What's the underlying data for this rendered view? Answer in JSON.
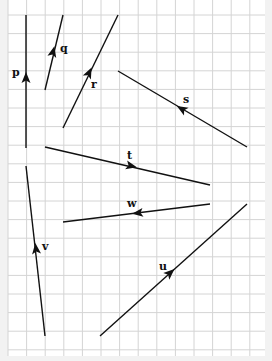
{
  "diagram": {
    "type": "vector-grid",
    "grid": {
      "x0": 8,
      "y0": -4,
      "x1": 265,
      "y1": 356,
      "cell": 18.6,
      "line_color": "#d4d4d4",
      "background": "#ffffff"
    },
    "line_color": "#111111",
    "vectors": [
      {
        "name": "p",
        "label": "p",
        "from": [
          26,
          148
        ],
        "to": [
          26,
          15
        ],
        "arrow": [
          26,
          78
        ],
        "label_pos": [
          12,
          76
        ]
      },
      {
        "name": "q",
        "label": "q",
        "from": [
          45,
          90
        ],
        "to": [
          63,
          15
        ],
        "arrow": [
          53,
          52
        ],
        "label_pos": [
          60,
          52
        ]
      },
      {
        "name": "r",
        "label": "r",
        "from": [
          63,
          128
        ],
        "to": [
          118,
          15
        ],
        "arrow": [
          89,
          73
        ],
        "label_pos": [
          91,
          88
        ]
      },
      {
        "name": "s",
        "label": "s",
        "from": [
          247,
          147
        ],
        "to": [
          118,
          71
        ],
        "arrow": [
          182,
          109
        ],
        "label_pos": [
          183,
          103
        ]
      },
      {
        "name": "t",
        "label": "t",
        "from": [
          45,
          147
        ],
        "to": [
          210,
          185
        ],
        "arrow": [
          131,
          166
        ],
        "label_pos": [
          127,
          159
        ]
      },
      {
        "name": "w",
        "label": "w",
        "from": [
          210,
          204
        ],
        "to": [
          63,
          222
        ],
        "arrow": [
          138,
          213
        ],
        "label_pos": [
          127,
          207
        ]
      },
      {
        "name": "v",
        "label": "v",
        "from": [
          45,
          336
        ],
        "to": [
          26,
          166
        ],
        "arrow": [
          36,
          249
        ],
        "label_pos": [
          42,
          250
        ]
      },
      {
        "name": "u",
        "label": "u",
        "from": [
          100,
          336
        ],
        "to": [
          247,
          204
        ],
        "arrow": [
          170,
          273
        ],
        "label_pos": [
          159,
          270
        ]
      }
    ]
  }
}
